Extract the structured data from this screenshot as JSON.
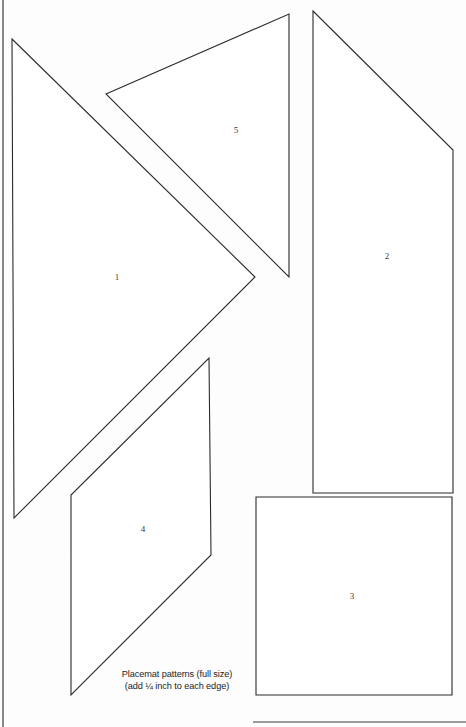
{
  "page": {
    "background_color": "#fdfdfd",
    "ink_color": "#2b2b2b",
    "width": 466,
    "height": 727
  },
  "caption": {
    "line1": "Placemat patterns (full size)",
    "line2": "(add ¼ inch to each edge)"
  },
  "shapes": [
    {
      "id": "piece-1",
      "label": "1",
      "kind": "triangle",
      "points": "12,39 255,277 14,518",
      "label_x": 117,
      "label_y": 278
    },
    {
      "id": "piece-5",
      "label": "5",
      "kind": "triangle",
      "points": "106,94 289,14 289,277",
      "label_x": 236,
      "label_y": 131
    },
    {
      "id": "piece-2",
      "label": "2",
      "kind": "quadrilateral",
      "points": "313,11 453,150 453,493 313,493",
      "label_x": 387,
      "label_y": 257
    },
    {
      "id": "piece-4",
      "label": "4",
      "kind": "parallelogram",
      "points": "209,358 211,555 71,695 71,495",
      "label_x": 143,
      "label_y": 530
    },
    {
      "id": "piece-3",
      "label": "3",
      "kind": "square",
      "points": "256,497 452,497 452,695 256,695",
      "label_x": 352,
      "label_y": 597
    }
  ],
  "rules": [
    {
      "id": "page-left-edge",
      "x1": 3,
      "y1": 0,
      "x2": 3,
      "y2": 727
    },
    {
      "id": "page-bottom-edge",
      "x1": 253,
      "y1": 722,
      "x2": 466,
      "y2": 722
    }
  ],
  "caption_position": {
    "x": 177,
    "y1": 677,
    "y2": 689
  }
}
